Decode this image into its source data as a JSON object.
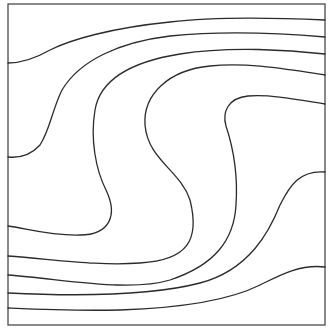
{
  "diagram": {
    "type": "streamline-contour-plot",
    "frame": {
      "x": 8,
      "y": 4,
      "width": 317,
      "height": 321,
      "stroke": "#4a4a4a"
    },
    "line_color": "#2b2b2b",
    "background": "#ffffff",
    "contours": [
      {
        "id": "top-1",
        "d": "M325,20 C280,18 220,16 170,22 C110,28 70,40 50,50 C36,58 22,63 8,63"
      },
      {
        "id": "top-2",
        "d": "M325,37 C290,34 230,30 170,36 C120,42 80,60 62,90 C52,110 50,130 40,145 C30,156 18,158 8,157"
      },
      {
        "id": "s-outer",
        "d": "M325,54 C290,50 230,46 180,54 C130,62 100,80 95,110 C90,140 96,170 106,190 C118,215 110,235 80,235 C50,236 25,228 8,226"
      },
      {
        "id": "s-middle",
        "d": "M325,75 C290,70 250,62 210,66 C168,70 143,95 145,125 C148,160 180,170 190,200 C200,240 188,260 140,263 C100,266 60,260 8,256"
      },
      {
        "id": "s-inner",
        "d": "M325,104 C300,100 270,94 248,96 C228,98 222,112 226,126 C234,150 238,175 236,205 C234,240 215,265 170,280 C130,292 70,280 8,275"
      },
      {
        "id": "bottom-1",
        "d": "M325,172 C300,170 290,185 280,205 C270,230 250,270 200,283 C150,296 70,296 8,293"
      },
      {
        "id": "bottom-2",
        "d": "M325,267 C300,264 280,275 260,285 C230,300 180,308 120,310 C70,311 30,309 8,308"
      }
    ]
  }
}
